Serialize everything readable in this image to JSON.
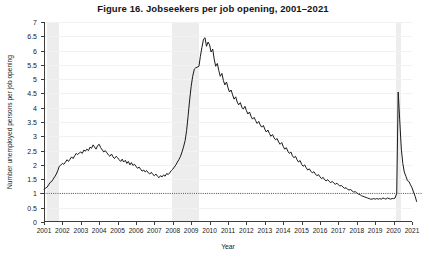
{
  "chart_data": {
    "type": "line",
    "title": "Figure 16.  Jobseekers per job opening, 2001–2021",
    "xlabel": "Year",
    "ylabel": "Number unemployed persons per job opening",
    "xlim": [
      2001,
      2021
    ],
    "ylim": [
      0,
      7
    ],
    "grid": true,
    "legend": "none",
    "y_ticks": [
      0,
      0.5,
      1,
      1.5,
      2,
      2.5,
      3,
      3.5,
      4,
      4.5,
      5,
      5.5,
      6,
      6.5,
      7
    ],
    "y_tick_labels": [
      "0",
      "0.5",
      "1",
      "1.5",
      "2",
      "2.5",
      "3",
      "3.5",
      "4",
      "4.5",
      "5",
      "5.5",
      "6",
      "6.5",
      "7"
    ],
    "x_ticks": [
      2001,
      2002,
      2003,
      2004,
      2005,
      2006,
      2007,
      2008,
      2009,
      2010,
      2011,
      2012,
      2013,
      2014,
      2015,
      2016,
      2017,
      2018,
      2019,
      2020,
      2021
    ],
    "x_tick_labels": [
      "2001",
      "2002",
      "2003",
      "2004",
      "2005",
      "2006",
      "2007",
      "2008",
      "2009",
      "2010",
      "2011",
      "2012",
      "2013",
      "2014",
      "2015",
      "2016",
      "2017",
      "2018",
      "2019",
      "2020",
      "2021"
    ],
    "reference_line": {
      "value": 1,
      "style": "dotted",
      "label": "1 jobseeker per opening"
    },
    "shaded_regions": [
      {
        "name": "recession-2001",
        "start": 2001.17,
        "end": 2001.83
      },
      {
        "name": "recession-2008",
        "start": 2007.98,
        "end": 2009.45
      },
      {
        "name": "recession-2020",
        "start": 2020.12,
        "end": 2020.4
      }
    ],
    "series": [
      {
        "name": "Unemployed persons per job opening",
        "color": "#1a1a1a",
        "x": [
          2001.0,
          2001.08,
          2001.17,
          2001.25,
          2001.33,
          2001.42,
          2001.5,
          2001.58,
          2001.67,
          2001.75,
          2001.83,
          2001.92,
          2002.0,
          2002.08,
          2002.17,
          2002.25,
          2002.33,
          2002.42,
          2002.5,
          2002.58,
          2002.67,
          2002.75,
          2002.83,
          2002.92,
          2003.0,
          2003.08,
          2003.17,
          2003.25,
          2003.33,
          2003.42,
          2003.5,
          2003.58,
          2003.67,
          2003.75,
          2003.83,
          2003.92,
          2004.0,
          2004.08,
          2004.17,
          2004.25,
          2004.33,
          2004.42,
          2004.5,
          2004.58,
          2004.67,
          2004.75,
          2004.83,
          2004.92,
          2005.0,
          2005.08,
          2005.17,
          2005.25,
          2005.33,
          2005.42,
          2005.5,
          2005.58,
          2005.67,
          2005.75,
          2005.83,
          2005.92,
          2006.0,
          2006.08,
          2006.17,
          2006.25,
          2006.33,
          2006.42,
          2006.5,
          2006.58,
          2006.67,
          2006.75,
          2006.83,
          2006.92,
          2007.0,
          2007.08,
          2007.17,
          2007.25,
          2007.33,
          2007.42,
          2007.5,
          2007.58,
          2007.67,
          2007.75,
          2007.83,
          2007.92,
          2008.0,
          2008.08,
          2008.17,
          2008.25,
          2008.33,
          2008.42,
          2008.5,
          2008.58,
          2008.67,
          2008.75,
          2008.83,
          2008.92,
          2009.0,
          2009.08,
          2009.17,
          2009.25,
          2009.33,
          2009.42,
          2009.5,
          2009.58,
          2009.67,
          2009.75,
          2009.83,
          2009.92,
          2010.0,
          2010.08,
          2010.17,
          2010.25,
          2010.33,
          2010.42,
          2010.5,
          2010.58,
          2010.67,
          2010.75,
          2010.83,
          2010.92,
          2011.0,
          2011.08,
          2011.17,
          2011.25,
          2011.33,
          2011.42,
          2011.5,
          2011.58,
          2011.67,
          2011.75,
          2011.83,
          2011.92,
          2012.0,
          2012.08,
          2012.17,
          2012.25,
          2012.33,
          2012.42,
          2012.5,
          2012.58,
          2012.67,
          2012.75,
          2012.83,
          2012.92,
          2013.0,
          2013.08,
          2013.17,
          2013.25,
          2013.33,
          2013.42,
          2013.5,
          2013.58,
          2013.67,
          2013.75,
          2013.83,
          2013.92,
          2014.0,
          2014.08,
          2014.17,
          2014.25,
          2014.33,
          2014.42,
          2014.5,
          2014.58,
          2014.67,
          2014.75,
          2014.83,
          2014.92,
          2015.0,
          2015.08,
          2015.17,
          2015.25,
          2015.33,
          2015.42,
          2015.5,
          2015.58,
          2015.67,
          2015.75,
          2015.83,
          2015.92,
          2016.0,
          2016.08,
          2016.17,
          2016.25,
          2016.33,
          2016.42,
          2016.5,
          2016.58,
          2016.67,
          2016.75,
          2016.83,
          2016.92,
          2017.0,
          2017.08,
          2017.17,
          2017.25,
          2017.33,
          2017.42,
          2017.5,
          2017.58,
          2017.67,
          2017.75,
          2017.83,
          2017.92,
          2018.0,
          2018.08,
          2018.17,
          2018.25,
          2018.33,
          2018.42,
          2018.5,
          2018.58,
          2018.67,
          2018.75,
          2018.83,
          2018.92,
          2019.0,
          2019.08,
          2019.17,
          2019.25,
          2019.33,
          2019.42,
          2019.5,
          2019.58,
          2019.67,
          2019.75,
          2019.83,
          2019.92,
          2020.0,
          2020.08,
          2020.17,
          2020.25,
          2020.33,
          2020.42,
          2020.5,
          2020.58,
          2020.67,
          2020.75,
          2020.83,
          2020.92,
          2021.0,
          2021.08,
          2021.17,
          2021.25
        ],
        "y": [
          1.15,
          1.18,
          1.22,
          1.3,
          1.38,
          1.42,
          1.5,
          1.58,
          1.68,
          1.8,
          1.95,
          2.0,
          2.05,
          2.02,
          2.1,
          2.18,
          2.12,
          2.2,
          2.28,
          2.22,
          2.32,
          2.4,
          2.36,
          2.42,
          2.45,
          2.4,
          2.52,
          2.48,
          2.55,
          2.5,
          2.62,
          2.58,
          2.7,
          2.62,
          2.55,
          2.68,
          2.72,
          2.6,
          2.52,
          2.45,
          2.5,
          2.42,
          2.35,
          2.3,
          2.38,
          2.28,
          2.22,
          2.3,
          2.25,
          2.18,
          2.12,
          2.2,
          2.1,
          2.16,
          2.05,
          2.12,
          2.0,
          2.08,
          1.98,
          2.02,
          1.95,
          1.88,
          1.92,
          1.85,
          1.78,
          1.82,
          1.75,
          1.8,
          1.72,
          1.68,
          1.74,
          1.66,
          1.62,
          1.68,
          1.6,
          1.55,
          1.62,
          1.58,
          1.65,
          1.6,
          1.7,
          1.66,
          1.72,
          1.8,
          1.85,
          1.92,
          2.0,
          2.1,
          2.18,
          2.3,
          2.45,
          2.62,
          2.85,
          3.2,
          3.7,
          4.3,
          4.75,
          5.1,
          5.35,
          5.4,
          5.42,
          5.45,
          5.8,
          6.1,
          6.4,
          6.45,
          6.15,
          6.3,
          6.2,
          5.95,
          6.05,
          5.7,
          5.45,
          5.55,
          5.3,
          5.1,
          5.2,
          4.95,
          4.8,
          4.9,
          4.7,
          4.55,
          4.62,
          4.45,
          4.3,
          4.38,
          4.2,
          4.1,
          4.18,
          4.02,
          3.95,
          4.05,
          3.9,
          3.78,
          3.85,
          3.7,
          3.6,
          3.66,
          3.55,
          3.45,
          3.52,
          3.4,
          3.32,
          3.38,
          3.25,
          3.15,
          3.22,
          3.1,
          3.0,
          3.06,
          2.95,
          2.88,
          2.92,
          2.8,
          2.72,
          2.78,
          2.65,
          2.55,
          2.6,
          2.48,
          2.4,
          2.45,
          2.32,
          2.25,
          2.3,
          2.18,
          2.1,
          2.15,
          2.02,
          1.95,
          2.0,
          1.9,
          1.82,
          1.86,
          1.78,
          1.72,
          1.76,
          1.68,
          1.62,
          1.66,
          1.58,
          1.52,
          1.56,
          1.48,
          1.44,
          1.48,
          1.42,
          1.38,
          1.42,
          1.36,
          1.32,
          1.36,
          1.3,
          1.26,
          1.28,
          1.22,
          1.18,
          1.2,
          1.14,
          1.12,
          1.14,
          1.08,
          1.05,
          1.06,
          1.02,
          0.98,
          0.96,
          0.92,
          0.9,
          0.88,
          0.86,
          0.84,
          0.82,
          0.8,
          0.8,
          0.82,
          0.8,
          0.82,
          0.8,
          0.82,
          0.8,
          0.84,
          0.82,
          0.8,
          0.84,
          0.82,
          0.8,
          0.82,
          0.82,
          0.84,
          1.0,
          4.55,
          3.6,
          2.55,
          2.05,
          1.75,
          1.6,
          1.45,
          1.42,
          1.3,
          1.2,
          1.05,
          0.9,
          0.72
        ]
      }
    ]
  }
}
